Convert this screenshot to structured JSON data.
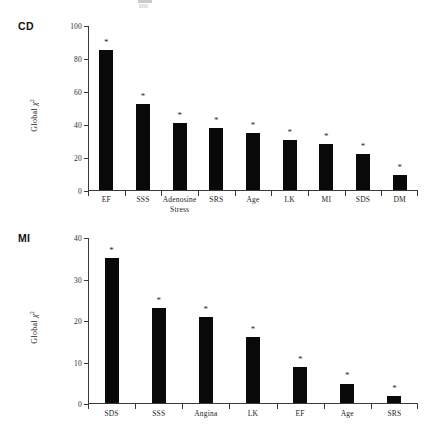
{
  "figure": {
    "background": "#ffffff",
    "bar_color": "#090909",
    "axis_color": "#3a3a3a",
    "text_color": "#242424",
    "significance_marker": "*"
  },
  "panels": [
    {
      "tag": "CD",
      "ylabel_prefix": "Global ",
      "ylabel_symbol": "χ",
      "ylabel_exponent": "2"
    },
    {
      "tag": "MI",
      "ylabel_prefix": "Global ",
      "ylabel_symbol": "χ",
      "ylabel_exponent": "2"
    }
  ],
  "chart_data": [
    {
      "type": "bar",
      "title": "CD",
      "xlabel": "",
      "ylabel": "Global χ²",
      "ylim": [
        0,
        100
      ],
      "yticks": [
        0,
        20,
        40,
        60,
        80,
        100
      ],
      "ytick_labels": [
        "0",
        "20",
        "40",
        "60",
        "80",
        "100"
      ],
      "grid": false,
      "legend": "none",
      "categories": [
        "EF",
        "SSS",
        "Adenosine Stress",
        "SRS",
        "Age",
        "LK",
        "MI",
        "SDS",
        "DM"
      ],
      "category_lines": [
        [
          "EF"
        ],
        [
          "SSS"
        ],
        [
          "Adenosine",
          "Stress"
        ],
        [
          "SRS"
        ],
        [
          "Age"
        ],
        [
          "LK"
        ],
        [
          "MI"
        ],
        [
          "SDS"
        ],
        [
          "DM"
        ]
      ],
      "values": [
        85,
        52,
        40.5,
        37.5,
        34.5,
        30.5,
        28,
        22,
        9
      ],
      "annotations": [
        "*",
        "*",
        "*",
        "*",
        "*",
        "*",
        "*",
        "*",
        "*"
      ]
    },
    {
      "type": "bar",
      "title": "MI",
      "xlabel": "",
      "ylabel": "Global χ²",
      "ylim": [
        0,
        40
      ],
      "yticks": [
        0,
        10,
        20,
        30,
        40
      ],
      "ytick_labels": [
        "0",
        "10",
        "20",
        "30",
        "40"
      ],
      "grid": false,
      "legend": "none",
      "categories": [
        "SDS",
        "SSS",
        "Angina",
        "LK",
        "EF",
        "Age",
        "SRS"
      ],
      "category_lines": [
        [
          "SDS"
        ],
        [
          "SSS"
        ],
        [
          "Angina"
        ],
        [
          "LK"
        ],
        [
          "EF"
        ],
        [
          "Age"
        ],
        [
          "SRS"
        ]
      ],
      "values": [
        35,
        22.8,
        20.8,
        15.8,
        8.7,
        4.7,
        1.6
      ],
      "annotations": [
        "*",
        "*",
        "*",
        "*",
        "*",
        "*",
        "*"
      ]
    }
  ]
}
